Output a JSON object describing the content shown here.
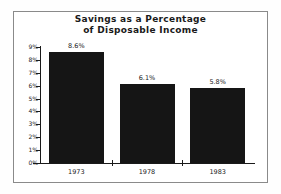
{
  "chart_data": {
    "type": "bar",
    "title": "Savings as a Percentage of Disposable Income",
    "title_lines": [
      "Savings as a Percentage",
      "of Disposable Income"
    ],
    "categories": [
      "1973",
      "1978",
      "1983"
    ],
    "values": [
      8.6,
      6.1,
      5.8
    ],
    "value_labels": [
      "8.6%",
      "6.1%",
      "5.8%"
    ],
    "xlabel": "",
    "ylabel": "",
    "ylim": [
      0,
      9
    ],
    "ytick_values": [
      9,
      8,
      7,
      6,
      5,
      4,
      3,
      2,
      1,
      0
    ],
    "ytick_labels": [
      "9%",
      "8%",
      "7%",
      "6%",
      "5%",
      "4%",
      "3%",
      "2%",
      "1%",
      "0%"
    ],
    "grid": false,
    "legend": false,
    "bar_color": "#151515",
    "axis_color": "#1a1a1a",
    "background_color": "#ffffff",
    "frame_color": "#8a8a8a"
  }
}
